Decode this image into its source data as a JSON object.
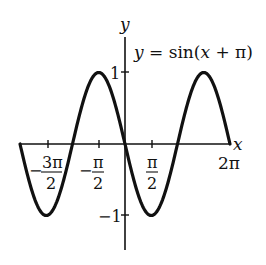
{
  "chart_data": {
    "type": "line",
    "title": "y = sin(x + π)",
    "function": "sin(x + pi)",
    "xlabel": "x",
    "ylabel": "y",
    "xlim": [
      -6.2832,
      6.2832
    ],
    "ylim": [
      -1.5,
      1.5
    ],
    "grid": false,
    "legend": null,
    "x_ticks": [
      {
        "value": -4.7124,
        "label_num": "3π",
        "label_den": "2",
        "sign": "−"
      },
      {
        "value": -1.5708,
        "label_num": "π",
        "label_den": "2",
        "sign": "−"
      },
      {
        "value": 1.5708,
        "label_num": "π",
        "label_den": "2",
        "sign": ""
      },
      {
        "value": 6.2832,
        "label": "2π"
      }
    ],
    "y_ticks": [
      {
        "value": 1,
        "label": "1"
      },
      {
        "value": -1,
        "label": "−1"
      }
    ],
    "series": [
      {
        "name": "y = sin(x + π)",
        "x": [
          -6.2832,
          -4.7124,
          -3.1416,
          -1.5708,
          0,
          1.5708,
          3.1416,
          4.7124,
          6.2832
        ],
        "values": [
          0,
          -1,
          0,
          1,
          0,
          -1,
          0,
          1,
          0
        ]
      }
    ],
    "color": "#111111"
  },
  "labels": {
    "equation": "y = sin(x + π)",
    "x_axis": "x",
    "y_axis": "y",
    "y_tick_pos": "1",
    "y_tick_neg": "−1",
    "x_tick_2pi": "2π",
    "x_tick_neg3pi2_sign": "−",
    "x_tick_neg3pi2_num": "3π",
    "x_tick_neg3pi2_den": "2",
    "x_tick_negpi2_sign": "−",
    "x_tick_negpi2_num": "π",
    "x_tick_negpi2_den": "2",
    "x_tick_pi2_num": "π",
    "x_tick_pi2_den": "2"
  }
}
